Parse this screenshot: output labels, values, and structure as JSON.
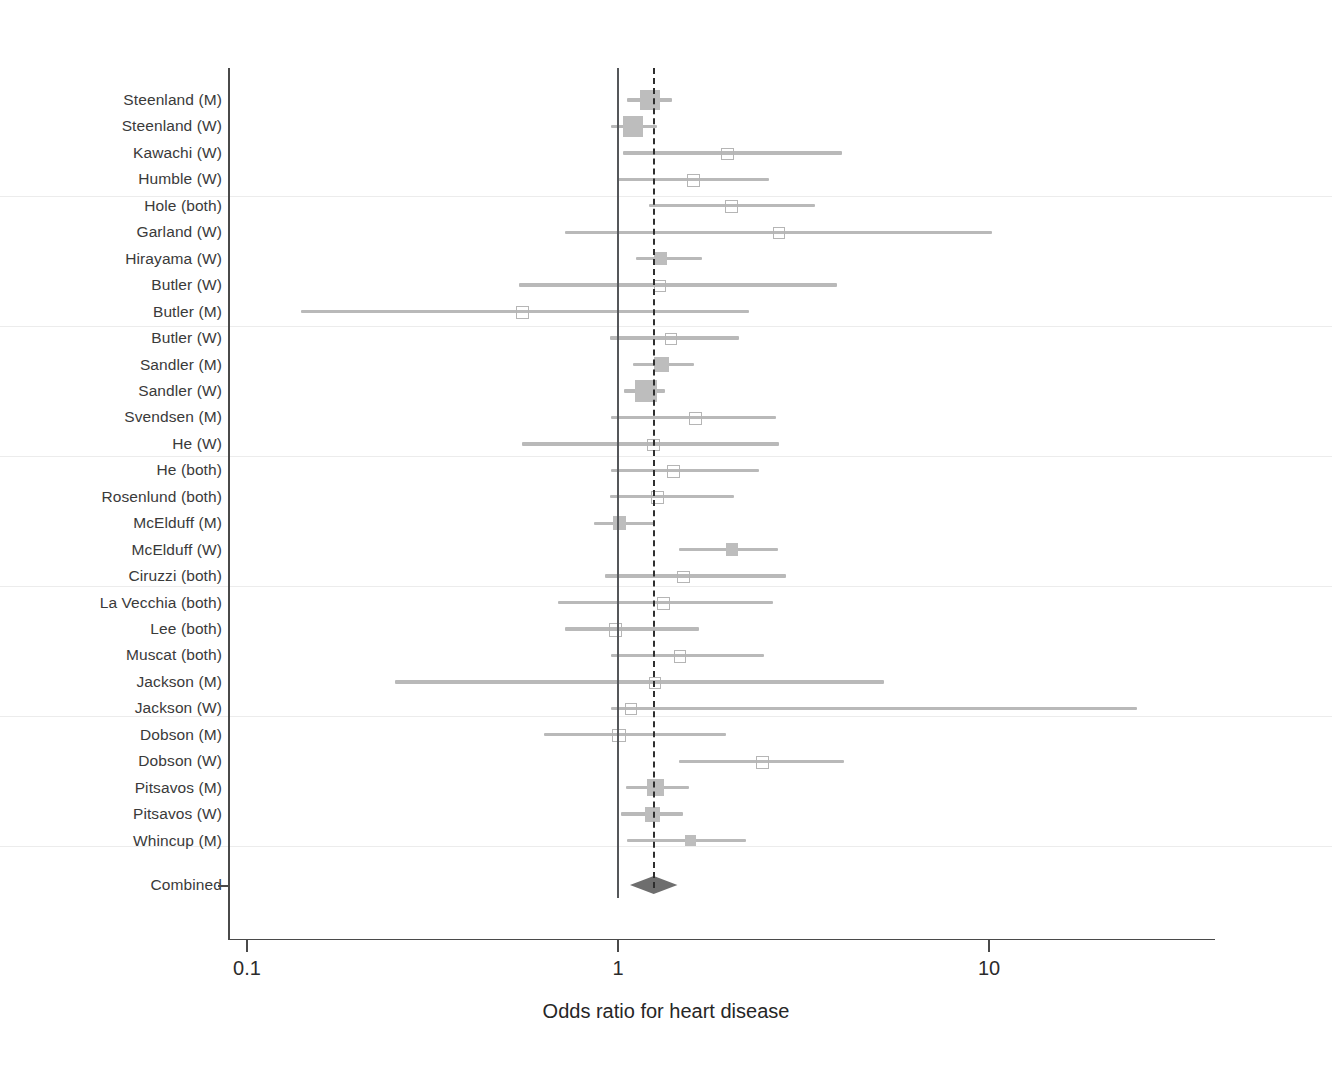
{
  "chart_data": {
    "type": "scatter",
    "subtype": "forest-plot",
    "title": "",
    "xlabel": "Odds ratio for heart disease",
    "ylabel": "",
    "xscale": "log",
    "xlim": [
      0.1,
      30
    ],
    "xticks": [
      0.1,
      1,
      10
    ],
    "xticklabels": [
      "0.1",
      "1",
      "10"
    ],
    "grid": false,
    "legend": null,
    "reference_lines": [
      {
        "name": "null-line",
        "value": 1.0,
        "style": "solid"
      },
      {
        "name": "pooled-estimate-line",
        "value": 1.25,
        "style": "dashed"
      }
    ],
    "categories": [
      "Steenland (M)",
      "Steenland (W)",
      "Kawachi (W)",
      "Humble (W)",
      "Hole (both)",
      "Garland (W)",
      "Hirayama (W)",
      "Butler (W)",
      "Butler (M)",
      "Butler (W)",
      "Sandler (M)",
      "Sandler (W)",
      "Svendsen (M)",
      "He (W)",
      "He (both)",
      "Rosenlund (both)",
      "McElduff (M)",
      "McElduff (W)",
      "Ciruzzi (both)",
      "La Vecchia (both)",
      "Lee (both)",
      "Muscat (both)",
      "Jackson (M)",
      "Jackson (W)",
      "Dobson (M)",
      "Dobson (W)",
      "Pitsavos (M)",
      "Pitsavos (W)",
      "Whincup (M)"
    ],
    "studies": [
      {
        "label": "Steenland (M)",
        "or": 1.22,
        "lo": 1.06,
        "hi": 1.4,
        "weight": 6.8
      },
      {
        "label": "Steenland (W)",
        "or": 1.1,
        "lo": 0.96,
        "hi": 1.27,
        "weight": 7.6
      },
      {
        "label": "Kawachi (W)",
        "or": 1.96,
        "lo": 1.03,
        "hi": 4.02,
        "weight": 1.1
      },
      {
        "label": "Humble (W)",
        "or": 1.59,
        "lo": 1.0,
        "hi": 2.56,
        "weight": 1.2
      },
      {
        "label": "Hole (both)",
        "or": 2.01,
        "lo": 1.21,
        "hi": 3.4,
        "weight": 1.1
      },
      {
        "label": "Garland (W)",
        "or": 2.7,
        "lo": 0.72,
        "hi": 10.18,
        "weight": 0.8
      },
      {
        "label": "Hirayama (W)",
        "or": 1.3,
        "lo": 1.12,
        "hi": 1.68,
        "weight": 2.3
      },
      {
        "label": "Butler (W)",
        "or": 1.29,
        "lo": 0.54,
        "hi": 3.9,
        "weight": 1.0
      },
      {
        "label": "Butler (M)",
        "or": 0.55,
        "lo": 0.14,
        "hi": 2.25,
        "weight": 1.0
      },
      {
        "label": "Butler (W)",
        "or": 1.38,
        "lo": 0.95,
        "hi": 2.12,
        "weight": 1.1
      },
      {
        "label": "Sandler (M)",
        "or": 1.31,
        "lo": 1.1,
        "hi": 1.6,
        "weight": 3.1
      },
      {
        "label": "Sandler (W)",
        "or": 1.19,
        "lo": 1.04,
        "hi": 1.34,
        "weight": 8.8
      },
      {
        "label": "Svendsen (M)",
        "or": 1.61,
        "lo": 0.96,
        "hi": 2.67,
        "weight": 1.1
      },
      {
        "label": "He (W)",
        "or": 1.24,
        "lo": 0.55,
        "hi": 2.72,
        "weight": 1.0
      },
      {
        "label": "He (both)",
        "or": 1.4,
        "lo": 0.96,
        "hi": 2.4,
        "weight": 1.1
      },
      {
        "label": "Rosenlund (both)",
        "or": 1.27,
        "lo": 0.95,
        "hi": 2.05,
        "weight": 1.2
      },
      {
        "label": "McElduff (M)",
        "or": 1.01,
        "lo": 0.86,
        "hi": 1.26,
        "weight": 2.4
      },
      {
        "label": "McElduff (W)",
        "or": 2.03,
        "lo": 1.46,
        "hi": 2.7,
        "weight": 2.0
      },
      {
        "label": "Ciruzzi (both)",
        "or": 1.49,
        "lo": 0.92,
        "hi": 2.84,
        "weight": 1.1
      },
      {
        "label": "La Vecchia (both)",
        "or": 1.32,
        "lo": 0.69,
        "hi": 2.61,
        "weight": 1.0
      },
      {
        "label": "Lee (both)",
        "or": 0.98,
        "lo": 0.72,
        "hi": 1.65,
        "weight": 1.2
      },
      {
        "label": "Muscat (both)",
        "or": 1.46,
        "lo": 0.96,
        "hi": 2.47,
        "weight": 1.1
      },
      {
        "label": "Jackson (M)",
        "or": 1.25,
        "lo": 0.25,
        "hi": 5.2,
        "weight": 0.9
      },
      {
        "label": "Jackson (W)",
        "or": 1.08,
        "lo": 0.96,
        "hi": 25.0,
        "weight": 0.8
      },
      {
        "label": "Dobson (M)",
        "or": 1.0,
        "lo": 0.63,
        "hi": 1.96,
        "weight": 1.2
      },
      {
        "label": "Dobson (W)",
        "or": 2.44,
        "lo": 1.46,
        "hi": 4.06,
        "weight": 1.2
      },
      {
        "label": "Pitsavos (M)",
        "or": 1.26,
        "lo": 1.05,
        "hi": 1.55,
        "weight": 4.6
      },
      {
        "label": "Pitsavos (W)",
        "or": 1.24,
        "lo": 1.02,
        "hi": 1.5,
        "weight": 3.4
      },
      {
        "label": "Whincup (M)",
        "or": 1.57,
        "lo": 1.06,
        "hi": 2.22,
        "weight": 1.4
      }
    ],
    "summary": {
      "label": "Combined",
      "or": 1.25,
      "lo": 1.17,
      "hi": 1.32,
      "marker": "diamond"
    },
    "annotations": []
  },
  "axis": {
    "x_title": "Odds ratio for heart disease",
    "x_tick_labels": [
      "0.1",
      "1",
      "10"
    ]
  },
  "summary_row": {
    "label": "Combined"
  },
  "colors": {
    "marker": "#bdbdbd",
    "ci": "#b9b9b9",
    "diamond": "#6e6e6e",
    "axis": "#4a4a4a",
    "null_line": "#55575a",
    "pooled_line": "#2e2e2e",
    "separator": "#ececec",
    "text": "#2b2b2b",
    "background": "#ffffff"
  }
}
